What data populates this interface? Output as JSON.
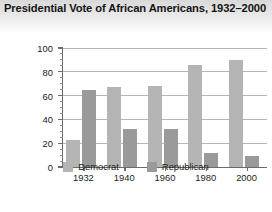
{
  "chart_data": {
    "type": "bar",
    "title": "Presidential Vote of African Americans, 1932–2000",
    "xlabel": "",
    "ylabel": "Percentage of African Americans who voted",
    "categories": [
      "1932",
      "1940",
      "1960",
      "1980",
      "2000"
    ],
    "series": [
      {
        "name": "Democrat",
        "color": "#b4b4b4",
        "values": [
          23,
          67,
          68,
          86,
          90
        ]
      },
      {
        "name": "Republican",
        "color": "#9a9a9a",
        "values": [
          65,
          32,
          32,
          12,
          9
        ]
      }
    ],
    "ylim": [
      0,
      100
    ],
    "yticks": [
      0,
      20,
      40,
      60,
      80,
      100
    ],
    "ytick_labels": [
      "0",
      "20",
      "40",
      "60",
      "80",
      "100"
    ],
    "grid": true,
    "legend_position": "bottom"
  },
  "legend": {
    "items": [
      {
        "label": "Democrat",
        "color": "#b4b4b4"
      },
      {
        "label": "Republican",
        "color": "#9a9a9a"
      }
    ]
  }
}
